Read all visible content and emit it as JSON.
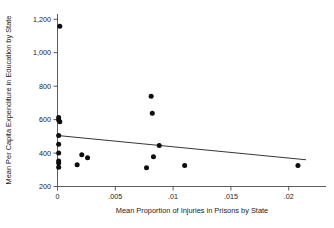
{
  "chart_data": {
    "type": "scatter",
    "title": "",
    "xlabel": "Mean Proportion of Injuries in Prisons by State",
    "ylabel": "Mean Per Capita Expenditure in Education by State",
    "xlim": [
      -0.0008,
      0.0225
    ],
    "ylim": [
      170,
      1240
    ],
    "grid": false,
    "legend": null,
    "xticks": [
      0,
      0.005,
      0.01,
      0.015,
      0.02
    ],
    "xtick_labels": [
      "0",
      ".005",
      ".01",
      ".015",
      ".02"
    ],
    "yticks": [
      200,
      400,
      600,
      800,
      1000,
      1200
    ],
    "ytick_labels": [
      "200",
      "400",
      "600",
      "800",
      "1,000",
      "1,200"
    ],
    "points": [
      {
        "x": 0.0002,
        "y": 1158
      },
      {
        "x": 0.0001,
        "y": 612
      },
      {
        "x": 0.0001,
        "y": 598
      },
      {
        "x": 0.0002,
        "y": 588
      },
      {
        "x": 0.0001,
        "y": 505
      },
      {
        "x": 0.0001,
        "y": 452
      },
      {
        "x": 0.0001,
        "y": 400
      },
      {
        "x": 0.0001,
        "y": 352
      },
      {
        "x": 0.0001,
        "y": 340
      },
      {
        "x": 0.0001,
        "y": 315
      },
      {
        "x": 0.0017,
        "y": 330
      },
      {
        "x": 0.0021,
        "y": 390
      },
      {
        "x": 0.0026,
        "y": 372
      },
      {
        "x": 0.0077,
        "y": 312
      },
      {
        "x": 0.0081,
        "y": 740
      },
      {
        "x": 0.0082,
        "y": 638
      },
      {
        "x": 0.0083,
        "y": 378
      },
      {
        "x": 0.0088,
        "y": 445
      },
      {
        "x": 0.011,
        "y": 325
      },
      {
        "x": 0.0208,
        "y": 325
      }
    ],
    "fit_line": {
      "name": "linear fit",
      "x": [
        0.0,
        0.0215
      ],
      "y": [
        505,
        360
      ]
    }
  }
}
